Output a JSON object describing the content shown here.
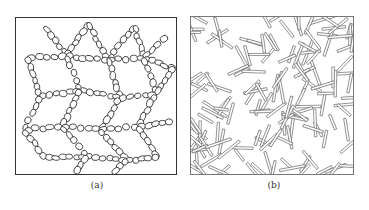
{
  "figure": {
    "panels": [
      {
        "id": "a",
        "caption": "(a)",
        "description": "network of chained oval particles (bead chains)",
        "stroke_color": "#2a2a2a",
        "border_color": "#333333"
      },
      {
        "id": "b",
        "caption": "(b)",
        "description": "randomly oriented rod-like particles",
        "stroke_color": "#555555",
        "border_color": "#777777"
      }
    ]
  }
}
